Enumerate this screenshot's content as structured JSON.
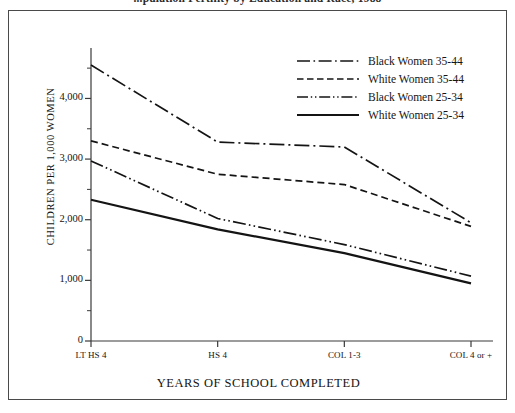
{
  "figure": {
    "clipped_title": "...pulation Fertility by Education and Race, 1988"
  },
  "chart_data": {
    "type": "line",
    "title": "",
    "xlabel": "YEARS OF SCHOOL COMPLETED",
    "ylabel": "CHILDREN PER 1,000 WOMEN",
    "categories": [
      "LT HS 4",
      "HS 4",
      "COL 1-3",
      "COL 4 or +"
    ],
    "ylim": [
      0,
      4700
    ],
    "yticks": [
      0,
      1000,
      2000,
      3000,
      4000
    ],
    "ytick_labels": [
      "0",
      "1,000",
      "2,000",
      "3,000",
      "4,000"
    ],
    "yminor_ticks": [
      500,
      1500,
      2500,
      3500,
      4500
    ],
    "grid": false,
    "legend_position": "top-right",
    "series": [
      {
        "name": "Black Women 35-44",
        "style": "dash-dot",
        "color": "#141414",
        "values": [
          4550,
          3280,
          3200,
          1950
        ]
      },
      {
        "name": "White Women 35-44",
        "style": "dashed",
        "color": "#141414",
        "values": [
          3300,
          2750,
          2580,
          1890
        ]
      },
      {
        "name": "Black Women 25-34",
        "style": "dash-dot-dot",
        "color": "#141414",
        "values": [
          2970,
          2020,
          1590,
          1070
        ]
      },
      {
        "name": "White Women 25-34",
        "style": "solid",
        "color": "#141414",
        "values": [
          2330,
          1840,
          1450,
          950
        ]
      }
    ]
  }
}
